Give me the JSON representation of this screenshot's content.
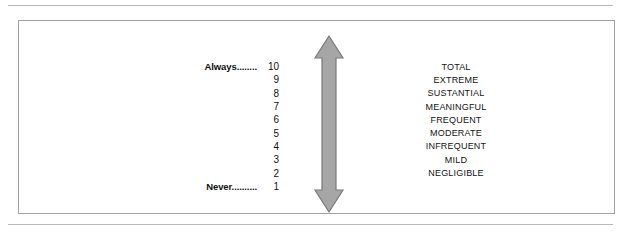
{
  "figure": {
    "anchors": {
      "high_label": "Always........",
      "high_value": "10",
      "low_label": "Never..........",
      "low_value": "1"
    },
    "scale_rows": [
      {
        "label": "Always........",
        "number": "10",
        "descriptor": "TOTAL"
      },
      {
        "label": "",
        "number": "9",
        "descriptor": "EXTREME"
      },
      {
        "label": "",
        "number": "8",
        "descriptor": "SUSTANTIAL"
      },
      {
        "label": "",
        "number": "7",
        "descriptor": "MEANINGFUL"
      },
      {
        "label": "",
        "number": "6",
        "descriptor": "FREQUENT"
      },
      {
        "label": "",
        "number": "5",
        "descriptor": "MODERATE"
      },
      {
        "label": "",
        "number": "4",
        "descriptor": "INFREQUENT"
      },
      {
        "label": "",
        "number": "3",
        "descriptor": "MILD"
      },
      {
        "label": "",
        "number": "2",
        "descriptor": "NEGLIGIBLE"
      },
      {
        "label": "Never..........",
        "number": "1",
        "descriptor": ""
      }
    ],
    "arrow": {
      "icon": "double-headed-vertical-arrow-icon",
      "fill_color": "#a6a6a6",
      "stroke_color": "#7a7a7a"
    },
    "colors": {
      "frame_border": "#a3a3a3",
      "rule": "#b9b9b9",
      "text": "#141414"
    }
  }
}
